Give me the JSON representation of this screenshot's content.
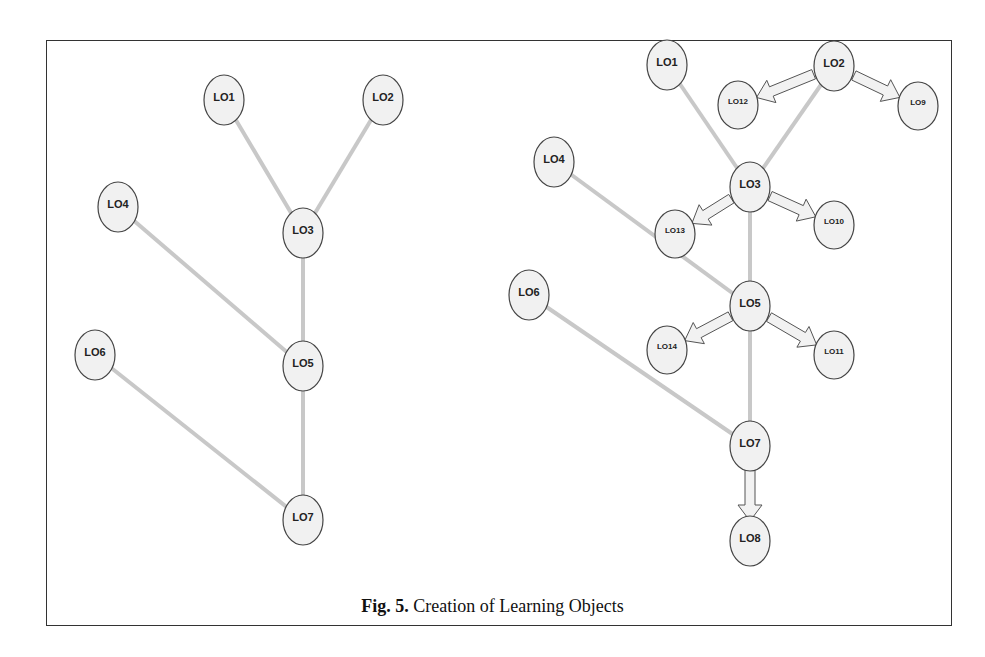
{
  "caption": {
    "prefix": "Fig. 5.",
    "text": "Creation of Learning Objects"
  },
  "colors": {
    "edge": "#c8c8c8",
    "arrow_fill": "#f2f2f2",
    "arrow_stroke": "#555555",
    "node_fill": "#f1f1f1",
    "node_stroke": "#444444",
    "frame": "#333333"
  },
  "graphs": [
    {
      "id": "left",
      "nodes": [
        {
          "id": "LO1",
          "label": "LO1",
          "x": 224,
          "y": 100,
          "size": "large"
        },
        {
          "id": "LO2",
          "label": "LO2",
          "x": 383,
          "y": 100,
          "size": "large"
        },
        {
          "id": "LO3",
          "label": "LO3",
          "x": 303,
          "y": 233,
          "size": "large"
        },
        {
          "id": "LO4",
          "label": "LO4",
          "x": 118,
          "y": 207,
          "size": "large"
        },
        {
          "id": "LO5",
          "label": "LO5",
          "x": 303,
          "y": 366,
          "size": "large"
        },
        {
          "id": "LO6",
          "label": "LO6",
          "x": 95,
          "y": 355,
          "size": "large"
        },
        {
          "id": "LO7",
          "label": "LO7",
          "x": 303,
          "y": 520,
          "size": "large"
        }
      ],
      "edges": [
        {
          "from": "LO1",
          "to": "LO3",
          "type": "line"
        },
        {
          "from": "LO2",
          "to": "LO3",
          "type": "line"
        },
        {
          "from": "LO3",
          "to": "LO5",
          "type": "line"
        },
        {
          "from": "LO4",
          "to": "LO5",
          "type": "line"
        },
        {
          "from": "LO5",
          "to": "LO7",
          "type": "line"
        },
        {
          "from": "LO6",
          "to": "LO7",
          "type": "line"
        }
      ]
    },
    {
      "id": "right",
      "nodes": [
        {
          "id": "LO1",
          "label": "LO1",
          "x": 667,
          "y": 65,
          "size": "large"
        },
        {
          "id": "LO2",
          "label": "LO2",
          "x": 834,
          "y": 66,
          "size": "large"
        },
        {
          "id": "LO12",
          "label": "LO12",
          "x": 738,
          "y": 105,
          "size": "small"
        },
        {
          "id": "LO9",
          "label": "LO9",
          "x": 918,
          "y": 106,
          "size": "small"
        },
        {
          "id": "LO4",
          "label": "LO4",
          "x": 554,
          "y": 162,
          "size": "large"
        },
        {
          "id": "LO3",
          "label": "LO3",
          "x": 750,
          "y": 187,
          "size": "large"
        },
        {
          "id": "LO13",
          "label": "LO13",
          "x": 675,
          "y": 234,
          "size": "small"
        },
        {
          "id": "LO10",
          "label": "LO10",
          "x": 834,
          "y": 225,
          "size": "small"
        },
        {
          "id": "LO6",
          "label": "LO6",
          "x": 529,
          "y": 295,
          "size": "large"
        },
        {
          "id": "LO5",
          "label": "LO5",
          "x": 750,
          "y": 306,
          "size": "large"
        },
        {
          "id": "LO14",
          "label": "LO14",
          "x": 667,
          "y": 350,
          "size": "small"
        },
        {
          "id": "LO11",
          "label": "LO11",
          "x": 834,
          "y": 355,
          "size": "small"
        },
        {
          "id": "LO7",
          "label": "LO7",
          "x": 750,
          "y": 446,
          "size": "large"
        },
        {
          "id": "LO8",
          "label": "LO8",
          "x": 750,
          "y": 541,
          "size": "large"
        }
      ],
      "edges": [
        {
          "from": "LO1",
          "to": "LO3",
          "type": "line"
        },
        {
          "from": "LO2",
          "to": "LO3",
          "type": "line"
        },
        {
          "from": "LO3",
          "to": "LO5",
          "type": "line"
        },
        {
          "from": "LO4",
          "to": "LO5",
          "type": "line"
        },
        {
          "from": "LO5",
          "to": "LO7",
          "type": "line"
        },
        {
          "from": "LO6",
          "to": "LO7",
          "type": "line"
        },
        {
          "from": "LO2",
          "to": "LO12",
          "type": "arrow"
        },
        {
          "from": "LO2",
          "to": "LO9",
          "type": "arrow"
        },
        {
          "from": "LO3",
          "to": "LO13",
          "type": "arrow"
        },
        {
          "from": "LO3",
          "to": "LO10",
          "type": "arrow"
        },
        {
          "from": "LO5",
          "to": "LO14",
          "type": "arrow"
        },
        {
          "from": "LO5",
          "to": "LO11",
          "type": "arrow"
        },
        {
          "from": "LO7",
          "to": "LO8",
          "type": "arrow"
        }
      ]
    }
  ]
}
